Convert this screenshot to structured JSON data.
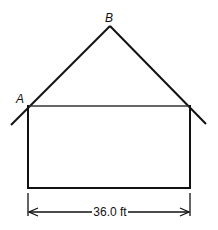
{
  "diagram": {
    "type": "house-cross-section",
    "points": {
      "A": "A",
      "B": "B"
    },
    "dimension": {
      "label": "36.0 ft"
    },
    "colors": {
      "stroke": "#111111",
      "background": "#ffffff"
    }
  }
}
